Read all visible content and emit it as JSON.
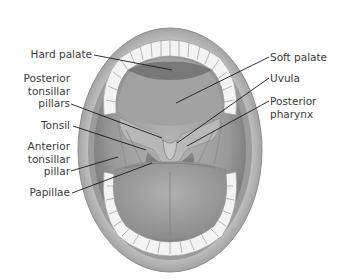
{
  "diagram": {
    "labels_left": [
      {
        "id": "hard-palate",
        "lines": [
          "Hard palate"
        ]
      },
      {
        "id": "posterior-tonsillar-pillars",
        "lines": [
          "Posterior",
          "tonsillar",
          "pillars"
        ]
      },
      {
        "id": "tonsil",
        "lines": [
          "Tonsil"
        ]
      },
      {
        "id": "anterior-tonsillar-pillar",
        "lines": [
          "Anterior",
          "tonsillar",
          "pillar"
        ]
      },
      {
        "id": "papillae",
        "lines": [
          "Papillae"
        ]
      }
    ],
    "labels_right": [
      {
        "id": "soft-palate",
        "lines": [
          "Soft palate"
        ]
      },
      {
        "id": "uvula",
        "lines": [
          "Uvula"
        ]
      },
      {
        "id": "posterior-pharynx",
        "lines": [
          "Posterior",
          "pharynx"
        ]
      }
    ],
    "colors": {
      "text": "#3a3a3a",
      "leader_line": "#1a1a1a",
      "lips": "#a9a9a9",
      "lips_dark": "#7d7d7d",
      "mouth_cavity": "#8f8f8f",
      "palate": "#b9b9b9",
      "tongue": "#a3a3a3",
      "teeth": "#f2f2f2"
    }
  }
}
